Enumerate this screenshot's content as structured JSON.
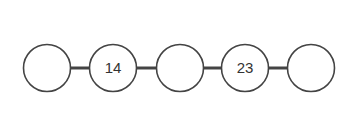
{
  "diagram": {
    "type": "linked-chain",
    "colors": {
      "stroke": "#444444",
      "fill": "#ffffff",
      "text": "#333333"
    },
    "nodes": [
      {
        "id": 1,
        "label": "",
        "cx": 47,
        "cy": 68
      },
      {
        "id": 2,
        "label": "14",
        "cx": 113,
        "cy": 68
      },
      {
        "id": 3,
        "label": "",
        "cx": 180,
        "cy": 68
      },
      {
        "id": 4,
        "label": "23",
        "cx": 245,
        "cy": 68
      },
      {
        "id": 5,
        "label": "",
        "cx": 311,
        "cy": 68
      }
    ],
    "radius": 23.5,
    "edges": [
      [
        1,
        2
      ],
      [
        2,
        3
      ],
      [
        3,
        4
      ],
      [
        4,
        5
      ]
    ]
  }
}
